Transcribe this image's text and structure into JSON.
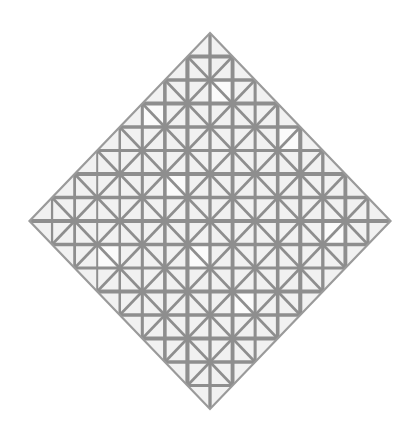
{
  "artwork": {
    "description": "Lozenge composition with grid lines (diamond-shaped grid painting)",
    "background_color": "#ffffff",
    "diamond_fill": "#f1f1f1",
    "line_color": "#8e8e8e",
    "outline_color": "#9a9a9a",
    "diamond": {
      "top": [
        210,
        33
      ],
      "right": [
        389,
        221
      ],
      "bottom": [
        210,
        409
      ],
      "left": [
        28,
        221
      ]
    },
    "grid": {
      "divisions": 16,
      "orthogonal_stroke": 3.6,
      "diagonal_stroke": 2.6,
      "outline_stroke": 2.2,
      "diagonal_step": 2
    },
    "light_cells": [
      [
        0,
        1
      ],
      [
        1,
        2
      ],
      [
        3,
        1
      ],
      [
        2,
        5
      ],
      [
        5,
        3
      ],
      [
        6,
        6
      ],
      [
        7,
        9
      ],
      [
        9,
        11
      ],
      [
        11,
        4
      ],
      [
        4,
        12
      ],
      [
        13,
        8
      ],
      [
        10,
        14
      ],
      [
        12,
        12
      ],
      [
        8,
        2
      ],
      [
        3,
        9
      ],
      [
        14,
        5
      ]
    ]
  }
}
